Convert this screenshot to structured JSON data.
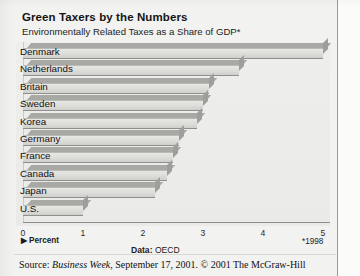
{
  "title": "Green Taxers by the Numbers",
  "subtitle": "Environmentally Related Taxes as a Share of GDP*",
  "percent_legend": "Percent",
  "percent_arrow": "▶",
  "footnote": "*1998",
  "data_source_label": "Data:",
  "data_source_value": "OECD",
  "source_line_prefix": "Source: ",
  "source_line_italic": "Business Week",
  "source_line_suffix": ", September 17, 2001. © 2001 The McGraw-Hill",
  "chart_data": {
    "type": "bar",
    "orientation": "horizontal",
    "title": "Green Taxers by the Numbers",
    "subtitle": "Environmentally Related Taxes as a Share of GDP*",
    "xlabel": "Percent",
    "ylabel": "",
    "xlim": [
      0,
      5
    ],
    "grid": false,
    "legend": "none",
    "xticks": [
      0,
      1,
      2,
      3,
      4,
      5
    ],
    "xtick_labels": [
      "0",
      "1",
      "2",
      "3",
      "4",
      "5"
    ],
    "categories": [
      "Denmark",
      "Netherlands",
      "Britain",
      "Sweden",
      "Korea",
      "Germany",
      "France",
      "Canada",
      "Japan",
      "U.S."
    ],
    "values": [
      5.0,
      3.6,
      3.1,
      3.0,
      2.9,
      2.6,
      2.5,
      2.4,
      2.2,
      1.0
    ],
    "annotations": [
      "*1998"
    ],
    "source": "Data: OECD"
  }
}
